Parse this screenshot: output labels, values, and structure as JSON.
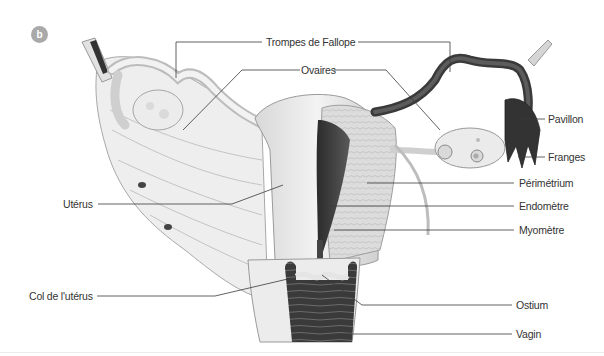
{
  "figure": {
    "panel_badge": "b",
    "labels": {
      "trompes": "Trompes de Fallope",
      "ovaires": "Ovaires",
      "pavillon": "Pavillon",
      "franges": "Franges",
      "uterus": "Utérus",
      "perimetrium": "Périmétrium",
      "endometre": "Endomètre",
      "myometre": "Myomètre",
      "col": "Col de l'utérus",
      "ostium": "Ostium",
      "vagin": "Vagin"
    },
    "colors": {
      "line": "#3a3a3a",
      "tissue_light": "#e9e9e9",
      "tissue_mid": "#c9c9c9",
      "tissue_dark": "#3d3d3d",
      "badge": "#a9a9a9"
    }
  }
}
